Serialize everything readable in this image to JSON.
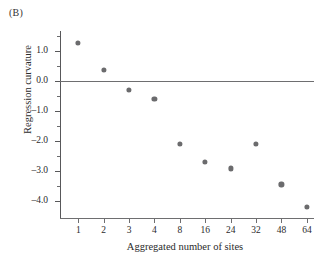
{
  "panel": {
    "label": "(B)"
  },
  "chart_data": {
    "type": "scatter",
    "title": "",
    "subtitle": "",
    "xlabel": "Aggregated number of sites",
    "ylabel": "Regression curvature",
    "categories": [
      "1",
      "2",
      "3",
      "4",
      "8",
      "16",
      "24",
      "32",
      "48",
      "64"
    ],
    "x": [
      1,
      2,
      3,
      4,
      8,
      16,
      24,
      32,
      48,
      64
    ],
    "values": [
      1.25,
      0.35,
      -0.32,
      -0.6,
      -2.1,
      -2.7,
      -2.92,
      -2.1,
      -3.45,
      -4.2
    ],
    "series": [
      {
        "name": "Regression curvature",
        "values": [
          1.25,
          0.35,
          -0.32,
          -0.6,
          -2.1,
          -2.7,
          -2.92,
          -2.1,
          -3.45,
          -4.2
        ]
      }
    ],
    "ylim": [
      -4.6,
      1.65
    ],
    "xlim_categorical": true,
    "ytick_labels": [
      "1.0",
      "0.0",
      "-1.0",
      "-2.0",
      "-3.0",
      "-4.0"
    ],
    "ytick_values": [
      1.0,
      0.0,
      -1.0,
      -2.0,
      -3.0,
      -4.0
    ],
    "yminor_values": [
      1.5,
      0.5,
      -0.5,
      -1.5,
      -2.5,
      -3.5
    ],
    "xtick_labels": [
      "1",
      "2",
      "3",
      "4",
      "8",
      "16",
      "24",
      "32",
      "48",
      "64"
    ],
    "grid": false,
    "legend": "none",
    "annotations": [
      {
        "name": "zero-reference-line",
        "y": 0.0
      }
    ],
    "marker_color": "#6b6b6d",
    "axis_color": "#6e6e70"
  }
}
